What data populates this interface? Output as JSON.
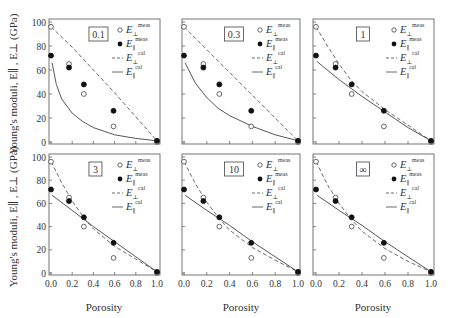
{
  "figure": {
    "ylabel": "Young's moduli, E∥ , E⊥ (GPa)",
    "xlabel": "Porosity",
    "y_ticks": [
      "0",
      "20",
      "40",
      "60",
      "80",
      "100"
    ],
    "x_ticks": [
      "0.0",
      "0.2",
      "0.4",
      "0.6",
      "0.8",
      "1.0"
    ],
    "legend": [
      {
        "symbol": "open-circle",
        "label": "E",
        "sub": "⊥",
        "sup": "meas"
      },
      {
        "symbol": "filled-circle",
        "label": "E",
        "sub": "∥",
        "sup": "meas"
      },
      {
        "symbol": "dashed-line",
        "label": "E",
        "sub": "⊥",
        "sup": "cal"
      },
      {
        "symbol": "solid-line",
        "label": "E",
        "sub": "∥",
        "sup": "cal"
      }
    ]
  },
  "chart_data": [
    {
      "type": "line",
      "panel_label": "0.1",
      "xlabel": "Porosity",
      "ylabel": "Young's moduli, E∥ , E⊥ (GPa)",
      "xlim": [
        0,
        1
      ],
      "ylim": [
        0,
        100
      ],
      "grid": false,
      "legend_position": "upper right",
      "series": [
        {
          "name": "E⊥ meas",
          "style": "open-circle",
          "x": [
            0,
            0.17,
            0.31,
            0.59,
            1.0
          ],
          "y": [
            96,
            65,
            40,
            13,
            0
          ]
        },
        {
          "name": "E∥ meas",
          "style": "filled-circle",
          "x": [
            0,
            0.17,
            0.31,
            0.59,
            1.0
          ],
          "y": [
            72,
            62,
            48,
            26,
            1
          ]
        },
        {
          "name": "E⊥ cal",
          "style": "dashed",
          "x": [
            0,
            0.2,
            0.4,
            0.6,
            0.8,
            1.0
          ],
          "y": [
            96,
            79,
            60,
            41,
            21,
            1
          ]
        },
        {
          "name": "E∥ cal",
          "style": "solid",
          "x": [
            0.01,
            0.05,
            0.1,
            0.2,
            0.3,
            0.4,
            0.6,
            0.8,
            1.0
          ],
          "y": [
            66,
            48,
            36,
            24,
            17,
            12,
            6,
            3,
            1
          ]
        }
      ]
    },
    {
      "type": "line",
      "panel_label": "0.3",
      "xlabel": "",
      "ylabel": "",
      "xlim": [
        0,
        1
      ],
      "ylim": [
        0,
        100
      ],
      "grid": false,
      "legend_position": "upper right",
      "series": [
        {
          "name": "E⊥ meas",
          "style": "open-circle",
          "x": [
            0,
            0.17,
            0.31,
            0.59,
            1.0
          ],
          "y": [
            96,
            65,
            40,
            13,
            0
          ]
        },
        {
          "name": "E∥ meas",
          "style": "filled-circle",
          "x": [
            0,
            0.17,
            0.31,
            0.59,
            1.0
          ],
          "y": [
            72,
            62,
            48,
            26,
            1
          ]
        },
        {
          "name": "E⊥ cal",
          "style": "dashed",
          "x": [
            0,
            0.2,
            0.4,
            0.6,
            0.8,
            1.0
          ],
          "y": [
            96,
            77,
            58,
            39,
            20,
            1
          ]
        },
        {
          "name": "E∥ cal",
          "style": "solid",
          "x": [
            0.01,
            0.1,
            0.2,
            0.3,
            0.4,
            0.6,
            0.8,
            1.0
          ],
          "y": [
            66,
            49,
            37,
            28,
            22,
            13,
            6,
            1
          ]
        }
      ]
    },
    {
      "type": "line",
      "panel_label": "1",
      "xlabel": "",
      "ylabel": "",
      "xlim": [
        0,
        1
      ],
      "ylim": [
        0,
        100
      ],
      "grid": false,
      "legend_position": "upper right",
      "series": [
        {
          "name": "E⊥ meas",
          "style": "open-circle",
          "x": [
            0,
            0.17,
            0.31,
            0.59,
            1.0
          ],
          "y": [
            96,
            65,
            40,
            13,
            0
          ]
        },
        {
          "name": "E∥ meas",
          "style": "filled-circle",
          "x": [
            0,
            0.17,
            0.31,
            0.59,
            1.0
          ],
          "y": [
            72,
            62,
            48,
            26,
            1
          ]
        },
        {
          "name": "E⊥ cal",
          "style": "dashed",
          "x": [
            0,
            0.1,
            0.2,
            0.3,
            0.4,
            0.6,
            0.8,
            1.0
          ],
          "y": [
            96,
            80,
            65,
            52,
            42,
            27,
            14,
            1
          ]
        },
        {
          "name": "E∥ cal",
          "style": "solid",
          "x": [
            0.01,
            0.2,
            0.4,
            0.6,
            0.8,
            1.0
          ],
          "y": [
            67,
            52,
            38,
            25,
            12,
            1
          ]
        }
      ]
    },
    {
      "type": "line",
      "panel_label": "3",
      "xlabel": "Porosity",
      "ylabel": "Young's moduli, E∥ , E⊥ (GPa)",
      "xlim": [
        0,
        1
      ],
      "ylim": [
        0,
        100
      ],
      "grid": false,
      "legend_position": "upper right",
      "series": [
        {
          "name": "E⊥ meas",
          "style": "open-circle",
          "x": [
            0,
            0.17,
            0.31,
            0.59,
            1.0
          ],
          "y": [
            96,
            65,
            40,
            13,
            0
          ]
        },
        {
          "name": "E∥ meas",
          "style": "filled-circle",
          "x": [
            0,
            0.17,
            0.31,
            0.59,
            1.0
          ],
          "y": [
            72,
            62,
            48,
            26,
            1
          ]
        },
        {
          "name": "E⊥ cal",
          "style": "dashed",
          "x": [
            0,
            0.1,
            0.2,
            0.3,
            0.4,
            0.6,
            0.8,
            1.0
          ],
          "y": [
            96,
            78,
            62,
            49,
            38,
            23,
            12,
            1
          ]
        },
        {
          "name": "E∥ cal",
          "style": "solid",
          "x": [
            0.01,
            0.2,
            0.4,
            0.6,
            0.8,
            1.0
          ],
          "y": [
            67,
            54,
            40,
            27,
            14,
            1
          ]
        }
      ]
    },
    {
      "type": "line",
      "panel_label": "10",
      "xlabel": "Porosity",
      "ylabel": "",
      "xlim": [
        0,
        1
      ],
      "ylim": [
        0,
        100
      ],
      "grid": false,
      "legend_position": "upper right",
      "series": [
        {
          "name": "E⊥ meas",
          "style": "open-circle",
          "x": [
            0,
            0.17,
            0.31,
            0.59,
            1.0
          ],
          "y": [
            96,
            65,
            40,
            13,
            0
          ]
        },
        {
          "name": "E∥ meas",
          "style": "filled-circle",
          "x": [
            0,
            0.17,
            0.31,
            0.59,
            1.0
          ],
          "y": [
            72,
            62,
            48,
            26,
            1
          ]
        },
        {
          "name": "E⊥ cal",
          "style": "dashed",
          "x": [
            0,
            0.1,
            0.2,
            0.3,
            0.4,
            0.6,
            0.8,
            1.0
          ],
          "y": [
            96,
            77,
            61,
            48,
            37,
            22,
            11,
            1
          ]
        },
        {
          "name": "E∥ cal",
          "style": "solid",
          "x": [
            0.01,
            0.2,
            0.4,
            0.6,
            0.8,
            1.0
          ],
          "y": [
            67,
            54,
            41,
            27,
            14,
            1
          ]
        }
      ]
    },
    {
      "type": "line",
      "panel_label": "∞",
      "xlabel": "Porosity",
      "ylabel": "",
      "xlim": [
        0,
        1
      ],
      "ylim": [
        0,
        100
      ],
      "grid": false,
      "legend_position": "upper right",
      "series": [
        {
          "name": "E⊥ meas",
          "style": "open-circle",
          "x": [
            0,
            0.17,
            0.31,
            0.59,
            1.0
          ],
          "y": [
            96,
            65,
            40,
            13,
            0
          ]
        },
        {
          "name": "E∥ meas",
          "style": "filled-circle",
          "x": [
            0,
            0.17,
            0.31,
            0.59,
            1.0
          ],
          "y": [
            72,
            62,
            48,
            26,
            1
          ]
        },
        {
          "name": "E⊥ cal",
          "style": "dashed",
          "x": [
            0,
            0.1,
            0.2,
            0.3,
            0.4,
            0.6,
            0.8,
            1.0
          ],
          "y": [
            96,
            76,
            60,
            47,
            36,
            21,
            10,
            1
          ]
        },
        {
          "name": "E∥ cal",
          "style": "solid",
          "x": [
            0.01,
            0.2,
            0.4,
            0.6,
            0.8,
            1.0
          ],
          "y": [
            67,
            54,
            41,
            27,
            14,
            1
          ]
        }
      ]
    }
  ]
}
